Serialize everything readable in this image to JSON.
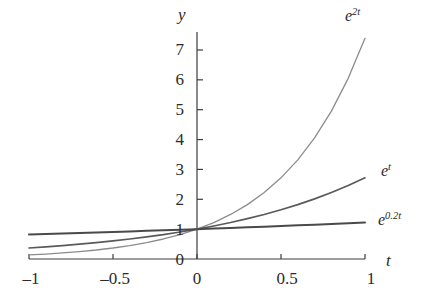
{
  "chart_data": {
    "type": "line",
    "title": "",
    "subtitle": "",
    "xlabel": "t",
    "ylabel": "y",
    "xlim": [
      -1,
      1
    ],
    "ylim": [
      0,
      7.6
    ],
    "grid": false,
    "legend": "inline-curve-labels",
    "x_ticks": [
      -1,
      -0.5,
      0,
      0.5,
      1
    ],
    "x_tick_labels": [
      "–1",
      "–0.5",
      "0",
      "0.5",
      "1"
    ],
    "y_ticks": [
      0,
      1,
      2,
      3,
      4,
      5,
      6,
      7
    ],
    "y_tick_labels": [
      "0",
      "1",
      "2",
      "3",
      "4",
      "5",
      "6",
      "7"
    ],
    "series": [
      {
        "name": "e^{2t}",
        "label_base": "e",
        "label_exp": "2t",
        "color": "#8c8c8c",
        "width": 1.3,
        "x": [
          -1,
          -0.9,
          -0.8,
          -0.7,
          -0.6,
          -0.5,
          -0.4,
          -0.3,
          -0.2,
          -0.1,
          0,
          0.1,
          0.2,
          0.3,
          0.4,
          0.5,
          0.6,
          0.7,
          0.8,
          0.9,
          1
        ],
        "values": [
          0.135,
          0.165,
          0.202,
          0.247,
          0.301,
          0.368,
          0.449,
          0.549,
          0.67,
          0.819,
          1.0,
          1.221,
          1.492,
          1.822,
          2.226,
          2.718,
          3.32,
          4.055,
          4.953,
          6.05,
          7.389
        ]
      },
      {
        "name": "e^{t}",
        "label_base": "e",
        "label_exp": "t",
        "color": "#5a5a5a",
        "width": 1.7,
        "x": [
          -1,
          -0.9,
          -0.8,
          -0.7,
          -0.6,
          -0.5,
          -0.4,
          -0.3,
          -0.2,
          -0.1,
          0,
          0.1,
          0.2,
          0.3,
          0.4,
          0.5,
          0.6,
          0.7,
          0.8,
          0.9,
          1
        ],
        "values": [
          0.368,
          0.407,
          0.449,
          0.497,
          0.549,
          0.607,
          0.67,
          0.741,
          0.819,
          0.905,
          1.0,
          1.105,
          1.221,
          1.35,
          1.492,
          1.649,
          1.822,
          2.014,
          2.226,
          2.46,
          2.718
        ]
      },
      {
        "name": "e^{0.2t}",
        "label_base": "e",
        "label_exp": "0.2t",
        "color": "#4a4a4a",
        "width": 2.0,
        "x": [
          -1,
          -0.9,
          -0.8,
          -0.7,
          -0.6,
          -0.5,
          -0.4,
          -0.3,
          -0.2,
          -0.1,
          0,
          0.1,
          0.2,
          0.3,
          0.4,
          0.5,
          0.6,
          0.7,
          0.8,
          0.9,
          1
        ],
        "values": [
          0.819,
          0.835,
          0.852,
          0.869,
          0.887,
          0.905,
          0.923,
          0.942,
          0.961,
          0.98,
          1.0,
          1.02,
          1.041,
          1.062,
          1.083,
          1.105,
          1.127,
          1.15,
          1.174,
          1.197,
          1.221
        ]
      }
    ],
    "axis_color": "#3c3c3c",
    "text_color": "#2b2b2b"
  },
  "labels": {
    "y_axis": "y",
    "x_axis": "t",
    "curve_1_base": "e",
    "curve_1_exp": "2t",
    "curve_2_base": "e",
    "curve_2_exp": "t",
    "curve_3_base": "e",
    "curve_3_exp": "0.2t",
    "ytick_7": "7",
    "ytick_6": "6",
    "ytick_5": "5",
    "ytick_4": "4",
    "ytick_3": "3",
    "ytick_2": "2",
    "ytick_1": "1",
    "ytick_0": "0",
    "xtick_m1": "–1",
    "xtick_m05": "–0.5",
    "xtick_0": "0",
    "xtick_05": "0.5",
    "xtick_1": "1"
  }
}
